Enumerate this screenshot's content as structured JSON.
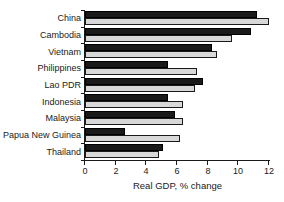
{
  "chart_data": {
    "type": "bar",
    "orientation": "horizontal",
    "title": "",
    "xlabel": "Real GDP, % change",
    "ylabel": "",
    "xlim": [
      0,
      12
    ],
    "xticks": [
      0,
      2,
      4,
      6,
      8,
      10,
      12
    ],
    "grid": false,
    "legend": "none",
    "categories": [
      "China",
      "Cambodia",
      "Vietnam",
      "Philippines",
      "Lao PDR",
      "Indonesia",
      "Malaysia",
      "Papua New Guinea",
      "Thailand"
    ],
    "series": [
      {
        "name": "black-series",
        "color": "#1a1a1a",
        "values": [
          11.2,
          10.8,
          8.3,
          5.4,
          7.7,
          5.4,
          5.9,
          2.6,
          5.1
        ]
      },
      {
        "name": "gray-series",
        "color": "#d8d8d8",
        "values": [
          12.0,
          9.6,
          8.6,
          7.3,
          7.2,
          6.4,
          6.4,
          6.2,
          4.8
        ]
      }
    ]
  },
  "colors": {
    "axis": "#1a1a1a",
    "background": "#ffffff",
    "bar_black": "#1a1a1a",
    "bar_gray": "#d8d8d8"
  }
}
